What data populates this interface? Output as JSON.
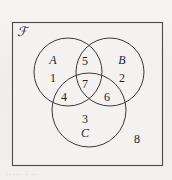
{
  "figure": {
    "type": "venn-diagram",
    "universe_symbol": "ℱ",
    "universe_symbol_name": "script-U-universal-set",
    "rect": {
      "x": 12,
      "y": 22,
      "width": 151,
      "height": 144
    },
    "stroke_color": "#3a3a3a",
    "background_color": "#f1f0ee",
    "text_color": "#1f1f1f"
  },
  "sets": [
    {
      "id": "A",
      "label": "A",
      "cx": 68,
      "cy": 72,
      "r": 34
    },
    {
      "id": "B",
      "label": "B",
      "cx": 110,
      "cy": 72,
      "r": 34
    },
    {
      "id": "C",
      "label": "C",
      "cx": 89,
      "cy": 110,
      "r": 37
    }
  ],
  "set_labels": [
    {
      "name": "set-label-a",
      "text": "A",
      "x": 53,
      "y": 60
    },
    {
      "name": "set-label-b",
      "text": "B",
      "x": 122,
      "y": 60
    },
    {
      "name": "set-label-c",
      "text": "C",
      "x": 85,
      "y": 133
    }
  ],
  "regions": [
    {
      "name": "region-a-only",
      "number": "1",
      "x": 53,
      "y": 78,
      "sets": "A only"
    },
    {
      "name": "region-b-only",
      "number": "2",
      "x": 122,
      "y": 78,
      "sets": "B only"
    },
    {
      "name": "region-c-only",
      "number": "3",
      "x": 85,
      "y": 119,
      "sets": "C only"
    },
    {
      "name": "region-a-and-c",
      "number": "4",
      "x": 64,
      "y": 97,
      "sets": "A and C"
    },
    {
      "name": "region-a-and-b",
      "number": "5",
      "x": 85,
      "y": 61,
      "sets": "A and B"
    },
    {
      "name": "region-b-and-c",
      "number": "6",
      "x": 107,
      "y": 97,
      "sets": "B and C"
    },
    {
      "name": "region-a-b-and-c",
      "number": "7",
      "x": 85,
      "y": 84,
      "sets": "A and B and C"
    },
    {
      "name": "region-outside",
      "number": "8",
      "x": 137,
      "y": 139,
      "sets": "outside all sets"
    }
  ],
  "caption": {
    "text": "·····  · ··"
  }
}
